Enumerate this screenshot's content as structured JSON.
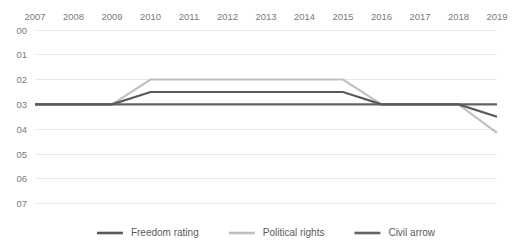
{
  "chart_data": {
    "type": "line",
    "title": "",
    "xlabel": "",
    "ylabel": "",
    "categories": [
      "2007",
      "2008",
      "2009",
      "2010",
      "2011",
      "2012",
      "2013",
      "2014",
      "2015",
      "2016",
      "2017",
      "2018",
      "2019"
    ],
    "y_ticks": [
      "00",
      "01",
      "02",
      "03",
      "04",
      "05",
      "06",
      "07"
    ],
    "y_tick_values": [
      0,
      1,
      2,
      3,
      4,
      5,
      6,
      7
    ],
    "ylim": [
      0,
      7
    ],
    "y_inverted": true,
    "grid": true,
    "legend_position": "bottom",
    "series": [
      {
        "name": "Freedom rating",
        "color": "#595959",
        "width": 2.2,
        "values": [
          3,
          3,
          3,
          2.5,
          2.5,
          2.5,
          2.5,
          2.5,
          2.5,
          3,
          3,
          3,
          3.5
        ]
      },
      {
        "name": "Political rights",
        "color": "#bfbfbf",
        "width": 2.0,
        "values": [
          3,
          3,
          3,
          2,
          2,
          2,
          2,
          2,
          2,
          3,
          3,
          3,
          4.15
        ]
      },
      {
        "name": "Civil arrow",
        "color": "#636363",
        "width": 2.2,
        "values": [
          3,
          3,
          3,
          3,
          3,
          3,
          3,
          3,
          3,
          3,
          3,
          3,
          3
        ]
      }
    ]
  },
  "legend": {
    "items": [
      {
        "label": "Freedom rating",
        "color": "#595959"
      },
      {
        "label": "Political rights",
        "color": "#bfbfbf"
      },
      {
        "label": "Civil arrow",
        "color": "#636363"
      }
    ]
  },
  "colors": {
    "grid": "#e8e8e8",
    "tick_text": "#7a7a7a",
    "legend_text": "#5a5a5a",
    "background": "#ffffff"
  }
}
